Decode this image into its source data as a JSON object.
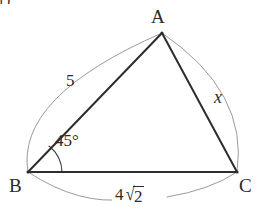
{
  "figure": {
    "problem_number": "1)",
    "type": "triangle-diagram",
    "background_color": "#ffffff",
    "edge_color": "#2d2d2d",
    "arc_color": "#9a9a9a",
    "text_color": "#2a2a2a"
  },
  "vertices": [
    {
      "id": "A",
      "label": "A",
      "x": 162,
      "y": 33
    },
    {
      "id": "B",
      "label": "B",
      "x": 28,
      "y": 172
    },
    {
      "id": "C",
      "label": "C",
      "x": 237,
      "y": 172
    }
  ],
  "sides": [
    {
      "id": "AB",
      "label": "5",
      "from": "B",
      "to": "A",
      "style": "plain"
    },
    {
      "id": "AC",
      "label": "x",
      "from": "A",
      "to": "C",
      "style": "italic"
    },
    {
      "id": "BC",
      "coefficient": "4",
      "radical_sign": "√",
      "radicand": "2",
      "label": "4√2",
      "from": "B",
      "to": "C",
      "style": "radical"
    }
  ],
  "angles": [
    {
      "at": "B",
      "label": "45°",
      "value": 45,
      "unit": "degrees"
    }
  ],
  "arcs": [
    {
      "id": "arc-ab",
      "from": "B",
      "to": "A",
      "bows": "outward-left"
    },
    {
      "id": "arc-ac",
      "from": "A",
      "to": "C",
      "bows": "outward-right"
    },
    {
      "id": "arc-bc",
      "from": "B",
      "to": "C",
      "bows": "outward-down"
    }
  ]
}
